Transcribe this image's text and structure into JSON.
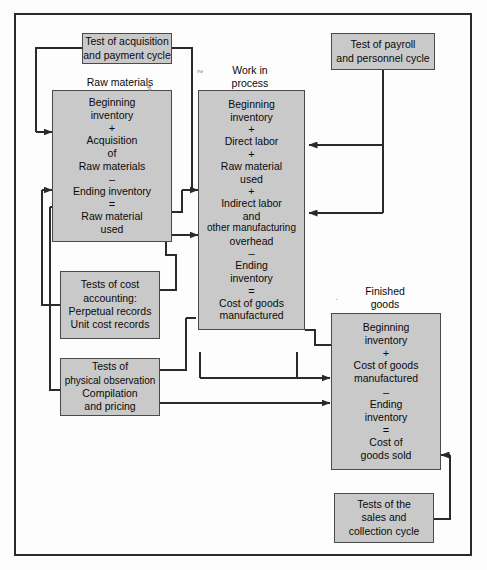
{
  "diagram": {
    "frame_border_color": "#2a2a2a",
    "box_fill_color": "#c9c9c9",
    "box_border_color": "#4a4a4a",
    "line_color": "#2a2a2a",
    "captions": {
      "raw_materials": "Raw materials",
      "work_in_process_line1": "Work in",
      "work_in_process_line2": "process",
      "finished_goods_line1": "Finished",
      "finished_goods_line2": "goods"
    },
    "boxes": {
      "acquisition": {
        "lines": [
          "Test of acquisition",
          "and payment cycle"
        ]
      },
      "payroll": {
        "lines": [
          "Test of payroll",
          "and personnel cycle"
        ]
      },
      "raw_materials": {
        "lines": [
          "Beginning",
          "inventory",
          "+",
          "Acquisition",
          "of",
          "Raw materials",
          "–",
          "Ending inventory",
          "=",
          "Raw material",
          "used"
        ],
        "operators": [
          "+",
          "–",
          "="
        ]
      },
      "work_in_process": {
        "lines": [
          "Beginning",
          "inventory",
          "+",
          "Direct labor",
          "+",
          "Raw material",
          "used",
          "+",
          "Indirect labor",
          "and",
          "other manufacturing",
          "overhead",
          "–",
          "Ending",
          "inventory",
          "=",
          "Cost of goods",
          "manufactured"
        ]
      },
      "finished_goods": {
        "lines": [
          "Beginning",
          "inventory",
          "+",
          "Cost of goods",
          "manufactured",
          "–",
          "Ending",
          "inventory",
          "=",
          "Cost of",
          "goods sold"
        ]
      },
      "cost_accounting": {
        "lines": [
          "Tests of cost",
          "accounting:",
          "Perpetual records",
          "Unit cost records"
        ]
      },
      "physical_observation": {
        "lines": [
          "Tests of",
          "physical observation",
          "Compilation",
          "and pricing"
        ]
      },
      "sales": {
        "lines": [
          "Tests of the",
          "sales and",
          "collection cycle"
        ]
      }
    }
  }
}
